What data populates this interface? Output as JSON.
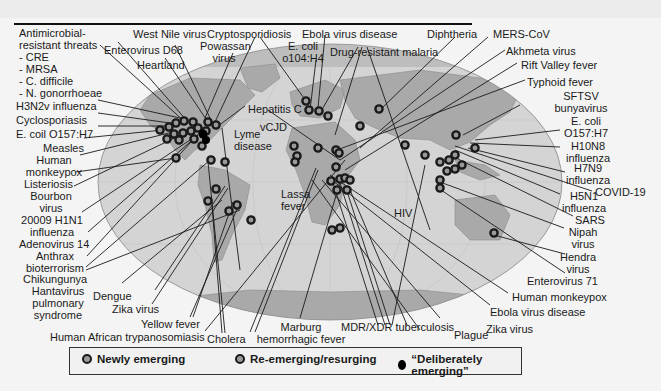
{
  "figure": {
    "colors": {
      "ocean_band": "#d4d4d4",
      "ocean_caps": "#bdbdbd",
      "land": "#a9a9a9",
      "marker_ring": "#1a1a1a",
      "marker_fill": "#9a9a9a",
      "deliberate_marker": "#000000",
      "leader_line": "#1a1a1a"
    },
    "labels_left": {
      "antimicrobial_1": "Antimicrobial-",
      "antimicrobial_2": "resistant threats",
      "cre": "- CRE",
      "mrsa": "- MRSA",
      "cdiff": "- C. difficile",
      "ngon": "- N. gonorrhoeae",
      "h3n2v": "H3N2v influenza",
      "cyclospor": "Cyclosporiasis",
      "ecoli_o157": "E. coil O157:H7",
      "measles": "Measles",
      "human_mpx_1": "Human",
      "human_mpx_2": "monkeypox",
      "listeriosis": "Listeriosis",
      "bourbon_1": "Bourbon",
      "bourbon_2": "virus",
      "h1n1_1": "20009 H1N1",
      "h1n1_2": "influenza",
      "adeno14": "Adenovirus 14",
      "anthrax_1": "Anthrax",
      "anthrax_2": "bioterrorism",
      "chikungunya": "Chikungunya",
      "hanta_1": "Hantavirus",
      "hanta_2": "pulmonary",
      "hanta_3": "syndrome"
    },
    "labels_top": {
      "west_nile": "West Nile virus",
      "entero_d68": "Enterovirus D68",
      "heartland": "Heartland",
      "crypto": "Cryptosporidiosis",
      "powassan_1": "Powassan",
      "powassan_2": "virus",
      "ebola_top": "Ebola virus disease",
      "ecoli_o104_1": "E. coli",
      "ecoli_o104_2": "o104:H4",
      "drug_malaria": "Drug-resistant malaria",
      "diphtheria": "Diphtheria",
      "mers": "MERS-CoV",
      "akhmeta": "Akhmeta virus",
      "rift_valley": "Rift Valley fever",
      "typhoid": "Typhoid fever"
    },
    "labels_map": {
      "hepatitis_c": "Hepatitis C",
      "vcjd": "vCJD",
      "lyme_1": "Lyme",
      "lyme_2": "disease",
      "lassa_1": "Lassa",
      "lassa_2": "fever",
      "hiv": "HIV"
    },
    "labels_right": {
      "sftsv_1": "SFTSV",
      "sftsv_2": "bunyavirus",
      "ecoli_r_1": "E. coli",
      "ecoli_r_2": "O157:H7",
      "h10n8_1": "H10N8",
      "h10n8_2": "influenza",
      "h7n9_1": "H7N9",
      "h7n9_2": "influenza",
      "covid": "COVID-19",
      "h5n1_1": "H5N1",
      "h5n1_2": "influenza",
      "sars": "SARS",
      "nipah_1": "Nipah",
      "nipah_2": "virus",
      "hendra_1": "Hendra",
      "hendra_2": "virus",
      "entero71": "Enterovirus 71",
      "human_mpx_r": "Human monkeypox",
      "ebola_bottom": "Ebola virus disease",
      "zika_r": "Zika virus"
    },
    "labels_bottom": {
      "dengue": "Dengue",
      "zika_l": "Zika virus",
      "yellow_fever": "Yellow fever",
      "hat": "Human African trypanosomiasis",
      "cholera": "Cholera",
      "marburg_1": "Marburg",
      "marburg_2": "hemorrhagic fever",
      "mdr_tb": "MDR/XDR tuberculosis",
      "plague": "Plague"
    },
    "legend": {
      "newly": "Newly emerging",
      "reemerging": "Re-emerging/resurging",
      "deliberate": "“Deliberately emerging”"
    }
  }
}
